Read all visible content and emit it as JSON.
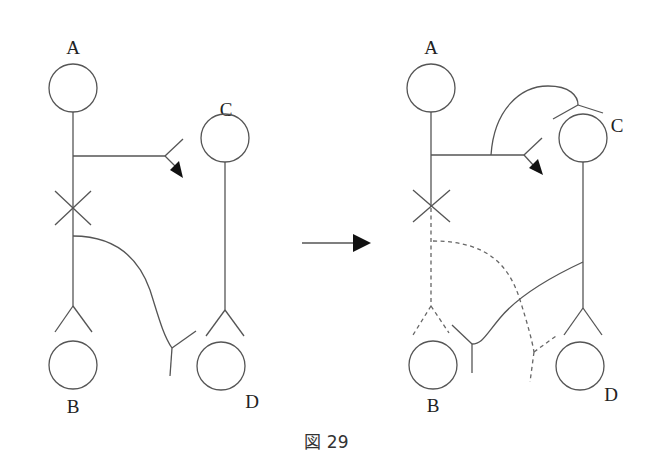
{
  "figure": {
    "caption": "図 29",
    "before": {
      "labels": {
        "a": "A",
        "b": "B",
        "c": "C",
        "d": "D"
      }
    },
    "after": {
      "labels": {
        "a": "A",
        "b": "B",
        "c": "C",
        "d": "D"
      }
    },
    "transition_arrow": "right-arrow"
  },
  "colors": {
    "line": "#555555",
    "arrowhead": "#111111",
    "background": "#ffffff"
  }
}
